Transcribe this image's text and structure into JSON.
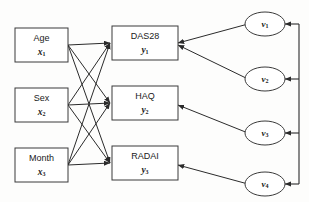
{
  "diagram": {
    "type": "path-diagram",
    "title": "",
    "background_color": "#fdfdfc",
    "line_color": "#2b2b2b",
    "box_fill": "#ffffff",
    "predictors": [
      {
        "id": "x1",
        "label": "Age",
        "var": "x",
        "subscript": "1"
      },
      {
        "id": "x2",
        "label": "Sex",
        "var": "x",
        "subscript": "2"
      },
      {
        "id": "x3",
        "label": "Month",
        "var": "x",
        "subscript": "3"
      }
    ],
    "outcomes": [
      {
        "id": "y1",
        "label": "DAS28",
        "var": "y",
        "subscript": "1"
      },
      {
        "id": "y2",
        "label": "HAQ",
        "var": "y",
        "subscript": "2"
      },
      {
        "id": "y3",
        "label": "RADAI",
        "var": "y",
        "subscript": "3"
      }
    ],
    "latents": [
      {
        "id": "v1",
        "var": "v",
        "subscript": "1"
      },
      {
        "id": "v2",
        "var": "v",
        "subscript": "2"
      },
      {
        "id": "v3",
        "var": "v",
        "subscript": "3"
      },
      {
        "id": "v4",
        "var": "v",
        "subscript": "4"
      }
    ],
    "edges_predictor_to_outcome": [
      {
        "from": "x1",
        "to": "y1"
      },
      {
        "from": "x1",
        "to": "y2"
      },
      {
        "from": "x1",
        "to": "y3"
      },
      {
        "from": "x2",
        "to": "y1"
      },
      {
        "from": "x2",
        "to": "y2"
      },
      {
        "from": "x2",
        "to": "y3"
      },
      {
        "from": "x3",
        "to": "y1"
      },
      {
        "from": "x3",
        "to": "y2"
      },
      {
        "from": "x3",
        "to": "y3"
      }
    ],
    "edges_latent_to_outcome": [
      {
        "from": "v1",
        "to": "y1"
      },
      {
        "from": "v2",
        "to": "y1"
      },
      {
        "from": "v3",
        "to": "y2"
      },
      {
        "from": "v4",
        "to": "y3"
      }
    ],
    "edges_bus_to_latent": [
      {
        "to": "v1"
      },
      {
        "to": "v2"
      },
      {
        "to": "v3"
      },
      {
        "to": "v4"
      }
    ]
  }
}
